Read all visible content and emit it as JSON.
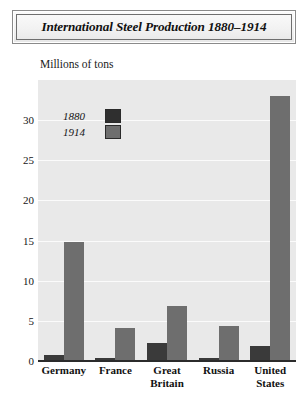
{
  "title": "International Steel Production 1880–1914",
  "axis_title": "Millions of tons",
  "legend": [
    {
      "label": "1880",
      "swatch": "#2f2f2f"
    },
    {
      "label": "1914",
      "swatch": "#6e6e6e"
    }
  ],
  "colors": {
    "series_1880": "#3a3a3a",
    "series_1914": "#6e6e6e",
    "plot_background": "#e9e9e9",
    "gridline": "#fbfbfb",
    "baseline": "#2b2b2b",
    "frame": "#6f6f6f"
  },
  "chart_data": {
    "type": "bar",
    "title": "International Steel Production 1880–1914",
    "xlabel": "",
    "ylabel": "Millions of tons",
    "ylim": [
      0,
      35
    ],
    "yticks": [
      0,
      5,
      10,
      15,
      20,
      25,
      30
    ],
    "ytick_labels": [
      "0",
      "5",
      "10",
      "15",
      "20",
      "25",
      "30"
    ],
    "grid": true,
    "legend_position": "upper-left-inside",
    "categories": [
      "Germany",
      "France",
      "Great Britain",
      "Russia",
      "United States"
    ],
    "category_lines": [
      [
        "Germany"
      ],
      [
        "France"
      ],
      [
        "Great",
        "Britain"
      ],
      [
        "Russia"
      ],
      [
        "United",
        "States"
      ]
    ],
    "series": [
      {
        "name": "1880",
        "values": [
          0.7,
          0.4,
          2.2,
          0.4,
          1.9
        ]
      },
      {
        "name": "1914",
        "values": [
          14.8,
          4.1,
          6.8,
          4.3,
          33.0
        ]
      }
    ]
  }
}
